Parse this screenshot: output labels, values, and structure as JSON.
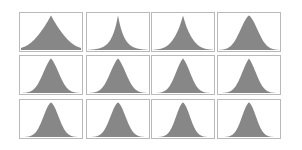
{
  "chart_data": {
    "type": "area",
    "title": "",
    "xlabel": "",
    "ylabel": "",
    "grid": false,
    "legend": null,
    "layout": {
      "rows": 3,
      "cols": 4
    },
    "fill_color": "#878787",
    "border_color": "#b9b9b9",
    "panels": [
      {
        "row": 0,
        "col": 0,
        "shape": "laplace-gauss",
        "center": 0.5,
        "width": 0.22,
        "peak": 0.96,
        "sharpness": 0.55
      },
      {
        "row": 0,
        "col": 1,
        "shape": "laplace",
        "center": 0.5,
        "width": 0.14,
        "peak": 0.96,
        "sharpness": 1.0
      },
      {
        "row": 0,
        "col": 2,
        "shape": "laplace-gauss",
        "center": 0.5,
        "width": 0.15,
        "peak": 0.96,
        "sharpness": 0.75
      },
      {
        "row": 0,
        "col": 3,
        "shape": "gaussian",
        "center": 0.5,
        "width": 0.15,
        "peak": 0.96,
        "sharpness": 0.15
      },
      {
        "row": 1,
        "col": 0,
        "shape": "gaussian",
        "center": 0.5,
        "width": 0.14,
        "peak": 0.96,
        "sharpness": 0.2
      },
      {
        "row": 1,
        "col": 1,
        "shape": "gaussian",
        "center": 0.5,
        "width": 0.14,
        "peak": 0.96,
        "sharpness": 0.2
      },
      {
        "row": 1,
        "col": 2,
        "shape": "gaussian",
        "center": 0.5,
        "width": 0.13,
        "peak": 0.96,
        "sharpness": 0.2
      },
      {
        "row": 1,
        "col": 3,
        "shape": "gaussian",
        "center": 0.5,
        "width": 0.13,
        "peak": 0.96,
        "sharpness": 0.25
      },
      {
        "row": 2,
        "col": 0,
        "shape": "gaussian",
        "center": 0.5,
        "width": 0.13,
        "peak": 0.96,
        "sharpness": 0.1
      },
      {
        "row": 2,
        "col": 1,
        "shape": "gaussian",
        "center": 0.5,
        "width": 0.13,
        "peak": 0.96,
        "sharpness": 0.1
      },
      {
        "row": 2,
        "col": 2,
        "shape": "gaussian",
        "center": 0.5,
        "width": 0.12,
        "peak": 0.96,
        "sharpness": 0.1
      },
      {
        "row": 2,
        "col": 3,
        "shape": "gaussian",
        "center": 0.5,
        "width": 0.12,
        "peak": 0.96,
        "sharpness": 0.1
      }
    ],
    "panel_geometry": {
      "col_lefts": [
        19,
        86,
        151,
        217
      ],
      "col_width": 64,
      "row_tops": [
        12,
        55,
        99
      ],
      "row_height": 40
    }
  }
}
